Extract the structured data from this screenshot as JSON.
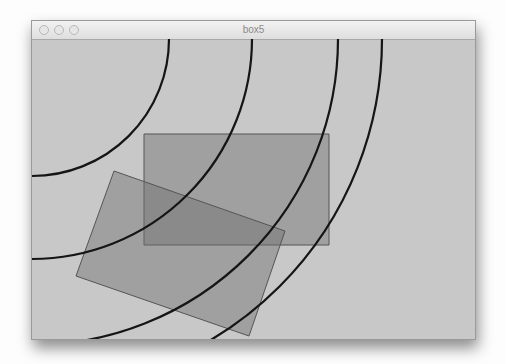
{
  "window": {
    "title": "box5",
    "controls": [
      "close",
      "minimize",
      "zoom"
    ]
  },
  "canvas": {
    "background": "#c8c8c8",
    "arcs": [
      {
        "cx": 0,
        "cy": 0,
        "r": 137
      },
      {
        "cx": 0,
        "cy": 0,
        "r": 220
      },
      {
        "cx": 0,
        "cy": 0,
        "r": 306
      },
      {
        "cx": 0,
        "cy": 0,
        "r": 350
      }
    ],
    "rects": [
      {
        "kind": "axis-aligned",
        "points": "112,95 297,95 297,206 112,206",
        "fill": "#6e6e6e"
      },
      {
        "kind": "rotated",
        "points": "82,132 253,192 217,297 44,237",
        "fill": "#6e6e6e"
      }
    ]
  }
}
